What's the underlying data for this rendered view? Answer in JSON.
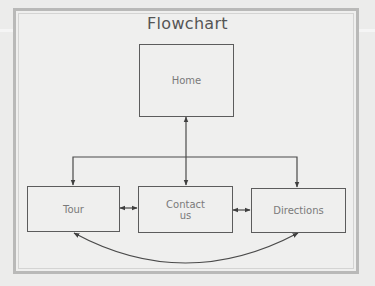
{
  "diagram": {
    "title": "Flowchart",
    "nodes": [
      {
        "id": "home",
        "label": "Home"
      },
      {
        "id": "tour",
        "label": "Tour"
      },
      {
        "id": "contact",
        "label": "Contact\nus",
        "label_line1": "Contact",
        "label_line2": "us"
      },
      {
        "id": "directions",
        "label": "Directions"
      }
    ],
    "edges": [
      {
        "from": "home",
        "to": "contact",
        "bidirectional": true
      },
      {
        "from": "home",
        "to": "tour",
        "bidirectional": false
      },
      {
        "from": "home",
        "to": "directions",
        "bidirectional": false
      },
      {
        "from": "tour",
        "to": "contact",
        "bidirectional": true
      },
      {
        "from": "contact",
        "to": "directions",
        "bidirectional": true
      },
      {
        "from": "tour",
        "to": "directions",
        "bidirectional": true,
        "style": "curved"
      }
    ],
    "colors": {
      "background": "#ececeb",
      "frame": "#b9b9b8",
      "stroke": "#4a4a4a",
      "text": "#7a7a7a"
    }
  }
}
